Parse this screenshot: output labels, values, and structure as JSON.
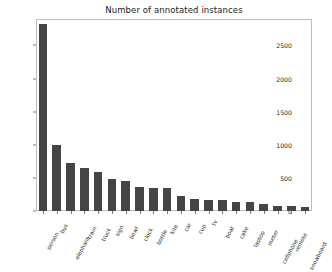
{
  "chart_data": {
    "type": "bar",
    "title": "Number of annotated instances",
    "xlabel": "",
    "ylabel": "",
    "categories": [
      "person",
      "bus",
      "elephant",
      "train",
      "truck",
      "sign",
      "bowl",
      "clock",
      "bottle",
      "kite",
      "car",
      "cup",
      "tv",
      "boat",
      "cake",
      "laptop",
      "meter",
      "cellphone",
      "remote",
      "snowboard"
    ],
    "values": [
      2830,
      1000,
      730,
      650,
      585,
      485,
      455,
      370,
      355,
      348,
      230,
      175,
      168,
      162,
      142,
      140,
      105,
      75,
      70,
      65
    ],
    "ylim": [
      0,
      2900
    ],
    "yticks": [
      0,
      500,
      1000,
      1500,
      2000,
      2500
    ],
    "ytick_labels": [
      "0",
      "500",
      "1000",
      "1500",
      "2000",
      "2500"
    ],
    "grid": false,
    "legend": null,
    "bar_color": "#454545",
    "frame_color": "#bdbdbd",
    "background": "#ffffff"
  }
}
